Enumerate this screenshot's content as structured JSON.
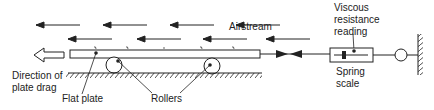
{
  "labels": {
    "airstream": "Airstream",
    "viscous_line1": "Viscous",
    "viscous_line2": "resistance",
    "viscous_line3": "reading",
    "direction_line1": "Direction of",
    "direction_line2": "plate drag",
    "flat_plate": "Flat plate",
    "rollers": "Rollers",
    "spring_line1": "Spring",
    "spring_line2": "scale"
  },
  "colors": {
    "stroke": "#222222",
    "background": "#ffffff"
  }
}
